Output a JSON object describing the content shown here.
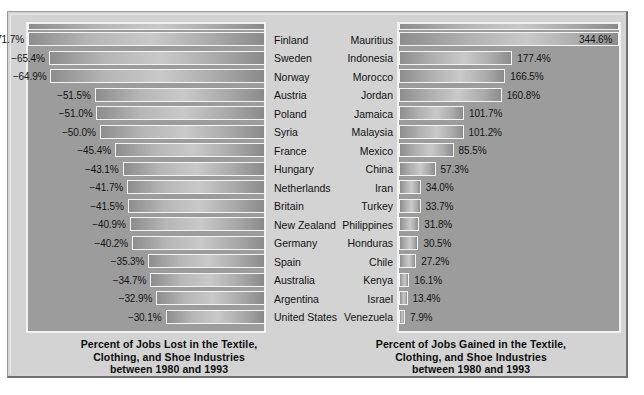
{
  "chart_data": [
    {
      "type": "bar",
      "id": "jobs-lost",
      "orientation": "horizontal",
      "title": "Percent of Jobs Lost in the Textile, Clothing, and Shoe Industries between 1980 and 1993",
      "caption_lines": [
        "Percent of Jobs Lost in the Textile,",
        "Clothing, and Shoe Industries",
        "between 1980 and 1993"
      ],
      "xlabel": "",
      "ylabel": "",
      "grid": false,
      "legend": "none",
      "value_suffix": "%",
      "xlim": [
        -71.7,
        0
      ],
      "categories": [
        "Finland",
        "Sweden",
        "Norway",
        "Austria",
        "Poland",
        "Syria",
        "France",
        "Hungary",
        "Netherlands",
        "Britain",
        "New Zealand",
        "Germany",
        "Spain",
        "Australia",
        "Argentina",
        "United States"
      ],
      "values": [
        -71.7,
        -65.4,
        -64.9,
        -51.5,
        -51.0,
        -50.0,
        -45.4,
        -43.1,
        -41.7,
        -41.5,
        -40.9,
        -40.2,
        -35.3,
        -34.7,
        -32.9,
        -30.1
      ],
      "labels": [
        "−71.7%",
        "−65.4%",
        "−64.9%",
        "−51.5%",
        "−51.0%",
        "−50.0%",
        "−45.4%",
        "−43.1%",
        "−41.7%",
        "−41.5%",
        "−40.9%",
        "−40.2%",
        "−35.3%",
        "−34.7%",
        "−32.9%",
        "−30.1%"
      ]
    },
    {
      "type": "bar",
      "id": "jobs-gained",
      "orientation": "horizontal",
      "title": "Percent of Jobs Gained in the Textile, Clothing, and Shoe Industries between 1980 and 1993",
      "caption_lines": [
        "Percent of Jobs Gained in the Textile,",
        "Clothing, and Shoe Industries",
        "between 1980 and 1993"
      ],
      "xlabel": "",
      "ylabel": "",
      "grid": false,
      "legend": "none",
      "value_suffix": "%",
      "xlim": [
        0,
        344.6
      ],
      "categories": [
        "Mauritius",
        "Indonesia",
        "Morocco",
        "Jordan",
        "Jamaica",
        "Malaysia",
        "Mexico",
        "China",
        "Iran",
        "Turkey",
        "Philippines",
        "Honduras",
        "Chile",
        "Kenya",
        "Israel",
        "Venezuela"
      ],
      "values": [
        344.6,
        177.4,
        166.5,
        160.8,
        101.7,
        101.2,
        85.5,
        57.3,
        34.0,
        33.7,
        31.8,
        30.5,
        27.2,
        16.1,
        13.4,
        7.9
      ],
      "labels": [
        "344.6%",
        "177.4%",
        "166.5%",
        "160.8%",
        "101.7%",
        "101.2%",
        "85.5%",
        "57.3%",
        "34.0%",
        "33.7%",
        "31.8%",
        "30.5%",
        "27.2%",
        "16.1%",
        "13.4%",
        "7.9%"
      ]
    }
  ],
  "colors": {
    "page_background": "#ffffff",
    "frame_background": "#d3d3d3",
    "plot_field": "#9c9c9c",
    "bar_outline": "#f4f4f4",
    "bar_dark": "#8d8d8d",
    "bar_light": "#c9c9c9",
    "text": "#111111"
  }
}
